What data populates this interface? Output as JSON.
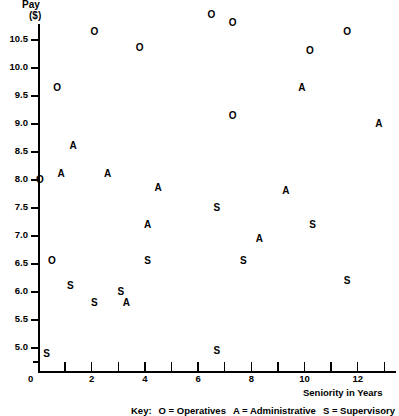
{
  "chart_data": {
    "type": "scatter",
    "title": "",
    "xlabel": "Seniority in Years",
    "ylabel": "Pay ($)",
    "ylabel_line1": "Pay",
    "ylabel_line2": "($)",
    "xlim": [
      0,
      13.5
    ],
    "ylim": [
      4.6,
      11.15
    ],
    "grid": false,
    "y_ticks": [
      10.5,
      10.0,
      9.5,
      9.0,
      8.5,
      8.0,
      7.5,
      7.0,
      6.5,
      6.0,
      5.5,
      5.0
    ],
    "y_tick_labels": [
      "10.5",
      "10.0",
      "9.5",
      "9.0",
      "8.5",
      "8.0",
      "7.5",
      "7.0",
      "6.5",
      "6.0",
      "5.5",
      "5.0"
    ],
    "y_minor_ticks": [
      4.75
    ],
    "x_ticks": [
      0,
      1,
      2,
      3,
      4,
      5,
      6,
      7,
      8,
      9,
      10,
      11,
      12,
      13
    ],
    "x_tick_labels": [
      "",
      "",
      "2",
      "",
      "4",
      "",
      "6",
      "",
      "8",
      "",
      "10",
      "",
      "12",
      ""
    ],
    "origin_label": "0",
    "legend_position": "below-center",
    "legend_prefix": "Key:",
    "legend": [
      {
        "marker": "O",
        "label": "Operatives"
      },
      {
        "marker": "A",
        "label": "Administrative"
      },
      {
        "marker": "S",
        "label": "Supervisory"
      }
    ],
    "series": [
      {
        "name": "Operatives",
        "marker": "O",
        "points": [
          {
            "x": 0.05,
            "y": 8.0
          },
          {
            "x": 0.5,
            "y": 6.55
          },
          {
            "x": 0.7,
            "y": 9.65
          },
          {
            "x": 2.1,
            "y": 10.65
          },
          {
            "x": 3.8,
            "y": 10.35
          },
          {
            "x": 6.5,
            "y": 10.95
          },
          {
            "x": 7.3,
            "y": 10.8
          },
          {
            "x": 7.3,
            "y": 9.15
          },
          {
            "x": 10.2,
            "y": 10.3
          },
          {
            "x": 11.6,
            "y": 10.65
          }
        ]
      },
      {
        "name": "Administrative",
        "marker": "A",
        "points": [
          {
            "x": 0.85,
            "y": 8.1
          },
          {
            "x": 1.3,
            "y": 8.6
          },
          {
            "x": 2.6,
            "y": 8.1
          },
          {
            "x": 3.3,
            "y": 5.8
          },
          {
            "x": 4.1,
            "y": 7.2
          },
          {
            "x": 4.5,
            "y": 7.85
          },
          {
            "x": 8.3,
            "y": 6.95
          },
          {
            "x": 9.3,
            "y": 7.8
          },
          {
            "x": 9.9,
            "y": 9.65
          },
          {
            "x": 12.8,
            "y": 9.0
          }
        ]
      },
      {
        "name": "Supervisory",
        "marker": "S",
        "points": [
          {
            "x": 0.3,
            "y": 4.9
          },
          {
            "x": 1.2,
            "y": 6.1
          },
          {
            "x": 2.1,
            "y": 5.8
          },
          {
            "x": 3.1,
            "y": 6.0
          },
          {
            "x": 4.1,
            "y": 6.55
          },
          {
            "x": 6.7,
            "y": 7.5
          },
          {
            "x": 6.7,
            "y": 4.95
          },
          {
            "x": 7.7,
            "y": 6.55
          },
          {
            "x": 10.3,
            "y": 7.2
          },
          {
            "x": 11.6,
            "y": 6.2
          }
        ]
      }
    ]
  }
}
